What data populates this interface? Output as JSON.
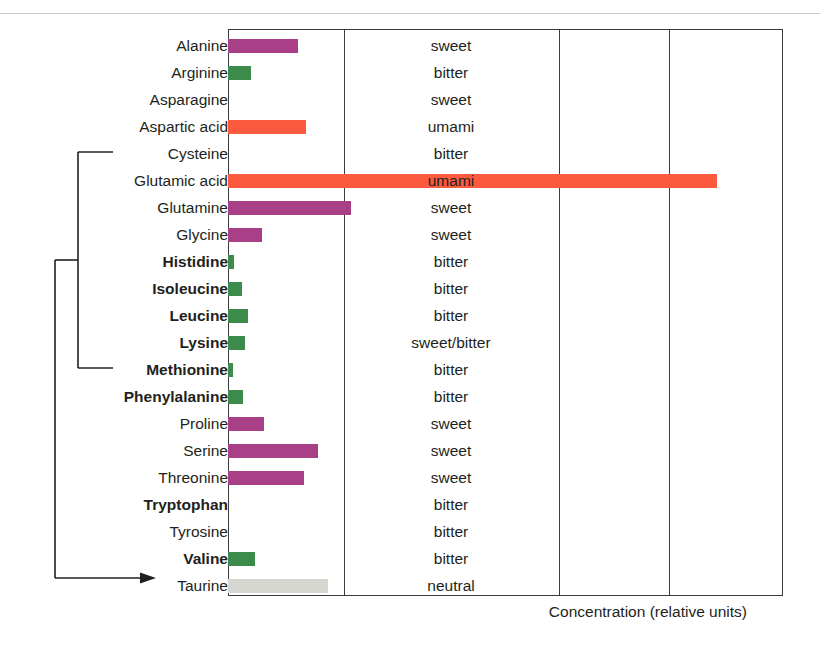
{
  "chart_data": {
    "type": "bar",
    "title": "",
    "xlabel": "Concentration (relative units)",
    "ylabel": "",
    "orientation": "horizontal",
    "grid": true,
    "gridlines_x": [
      0,
      1,
      2,
      3
    ],
    "xlim": [
      0,
      4.76
    ],
    "axis_unit_px": 116.5,
    "legend_position": "none",
    "categories": [
      "Alanine",
      "Arginine",
      "Asparagine",
      "Aspartic acid",
      "Cysteine",
      "Glutamic acid",
      "Glutamine",
      "Glycine",
      "Histidine",
      "Isoleucine",
      "Leucine",
      "Lysine",
      "Methionine",
      "Phenylalanine",
      "Proline",
      "Serine",
      "Threonine",
      "Tryptophan",
      "Tyrosine",
      "Valine",
      "Taurine"
    ],
    "values": [
      0.6,
      0.2,
      0.0,
      0.67,
      0.0,
      4.2,
      1.06,
      0.29,
      0.05,
      0.12,
      0.17,
      0.15,
      0.04,
      0.13,
      0.31,
      0.77,
      0.65,
      0.0,
      0.0,
      0.23,
      0.86
    ],
    "taste": [
      "sweet",
      "bitter",
      "sweet",
      "umami",
      "bitter",
      "umami",
      "sweet",
      "sweet",
      "bitter",
      "bitter",
      "bitter",
      "sweet/bitter",
      "bitter",
      "bitter",
      "sweet",
      "sweet",
      "sweet",
      "bitter",
      "bitter",
      "bitter",
      "neutral"
    ],
    "essential": [
      false,
      false,
      false,
      false,
      false,
      false,
      false,
      false,
      true,
      true,
      true,
      true,
      true,
      true,
      false,
      false,
      false,
      true,
      false,
      true,
      false
    ],
    "taste_colors": {
      "sweet": "#a93f87",
      "bitter": "#3d8b4b",
      "umami": "#fb5a3f",
      "sweet/bitter": "#3d8b4b",
      "neutral": "#d6d6d1"
    },
    "bar_colors": [
      "#a93f87",
      "#3d8b4b",
      "#a93f87",
      "#fb5a3f",
      "#3d8b4b",
      "#fb5a3f",
      "#a93f87",
      "#a93f87",
      "#3d8b4b",
      "#3d8b4b",
      "#3d8b4b",
      "#3d8b4b",
      "#3d8b4b",
      "#3d8b4b",
      "#a93f87",
      "#a93f87",
      "#a93f87",
      "#3d8b4b",
      "#3d8b4b",
      "#3d8b4b",
      "#d6d6d1"
    ],
    "annotation": {
      "bracket_from": "Cysteine",
      "bracket_to": "Methionine",
      "arrow_to": "Taurine"
    }
  },
  "colors": {
    "sweet": "#a93f87",
    "bitter": "#3d8b4b",
    "umami": "#fb5a3f",
    "neutral": "#d6d6d1",
    "axis": "#3b3b3b",
    "text": "#231f20"
  }
}
